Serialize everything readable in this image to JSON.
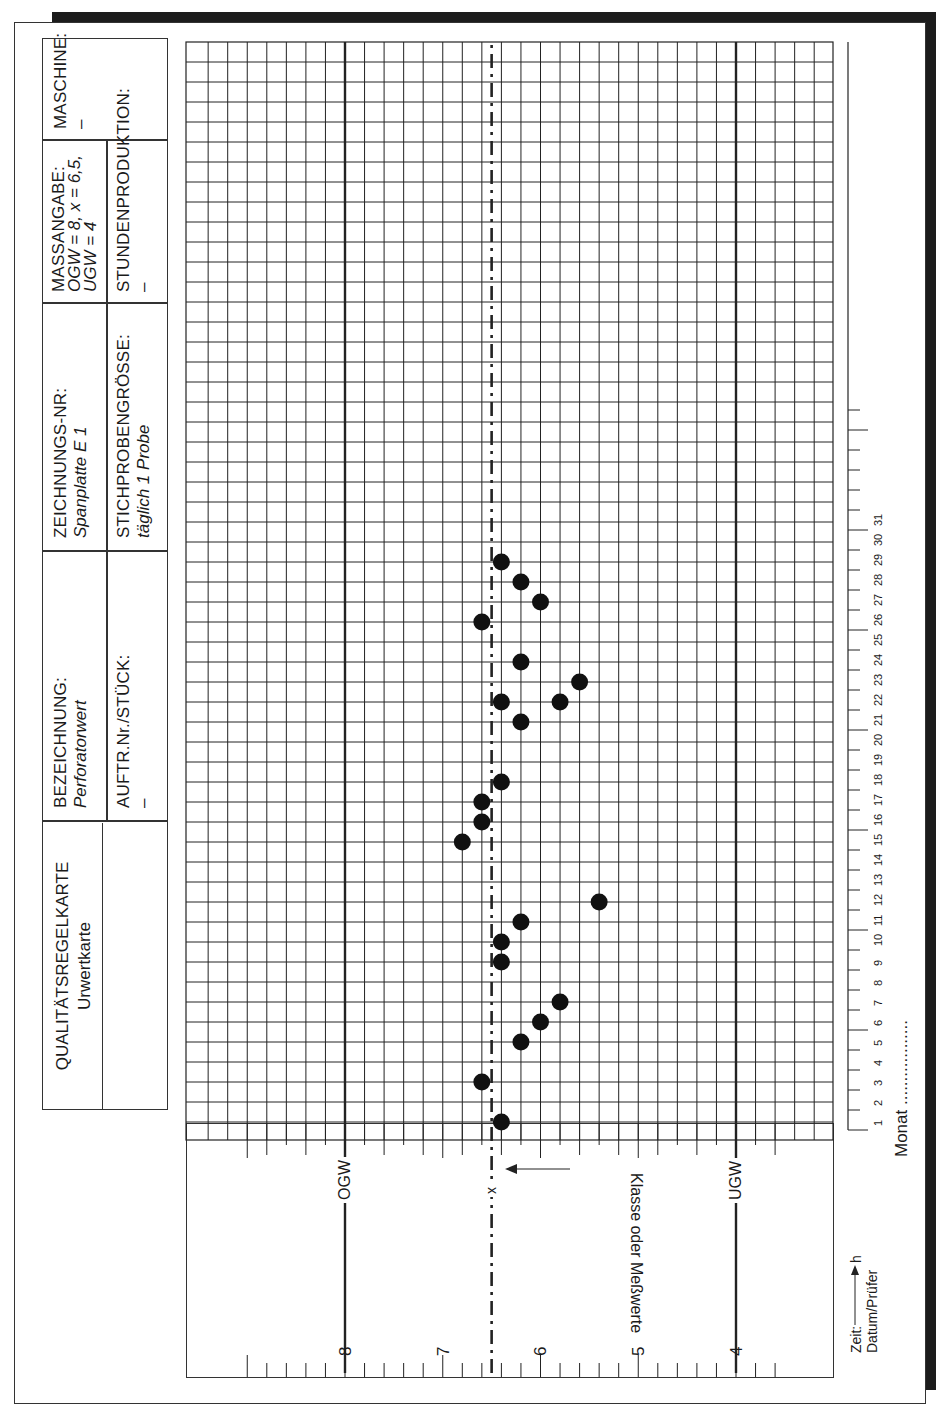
{
  "header": {
    "title": "QUALITÄTSREGELKARTE",
    "subtitle": "Urwertkarte",
    "fields": [
      {
        "label": "BEZEICHNUNG:",
        "value": "Perforatorwert"
      },
      {
        "label": "AUFTR.Nr./STÜCK:",
        "value": "–"
      },
      {
        "label": "ZEICHNUNGS-NR:",
        "value": "Spanplatte E 1"
      },
      {
        "label": "STICHPROBENGRÖSSE:",
        "value": "täglich 1 Probe"
      },
      {
        "label": "MASSANGABE:",
        "value_lines": [
          "OGW = 8, x = 6,5,",
          "UGW = 4"
        ]
      },
      {
        "label": "STUNDENPRODUKTION:",
        "value": "–"
      },
      {
        "label": "MASCHINE:",
        "value": "–"
      }
    ]
  },
  "axis": {
    "value_ticks": [
      "8",
      "7",
      "6",
      "5",
      "4"
    ],
    "ogw_label": "OGW",
    "ugw_label": "UGW",
    "mean_label": "x",
    "axis_caption": "Klasse oder Meßwerte",
    "time_label": "Zeit:",
    "time_unit": "h",
    "date_label": "Datum/Prüfer",
    "month_label": "Monat ..................",
    "day_ticks": [
      "1",
      "2",
      "3",
      "4",
      "5",
      "6",
      "7",
      "8",
      "9",
      "10",
      "11",
      "12",
      "13",
      "14",
      "15",
      "16",
      "17",
      "18",
      "19",
      "20",
      "21",
      "22",
      "23",
      "24",
      "25",
      "26",
      "27",
      "28",
      "29",
      "30",
      "31"
    ]
  },
  "chart_data": {
    "type": "scatter",
    "xlabel": "Datum (Tag des Monats)",
    "ylabel": "Klasse oder Meßwerte",
    "x_range": [
      1,
      31
    ],
    "ylim": [
      3.4,
      9.0
    ],
    "grid": true,
    "reference_lines": [
      {
        "name": "OGW",
        "value": 8.0,
        "style": "solid"
      },
      {
        "name": "x",
        "value": 6.5,
        "style": "dash-dot"
      },
      {
        "name": "UGW",
        "value": 4.0,
        "style": "solid"
      }
    ],
    "points": [
      {
        "x": 1,
        "y": 6.4
      },
      {
        "x": 3,
        "y": 6.6
      },
      {
        "x": 5,
        "y": 6.2
      },
      {
        "x": 6,
        "y": 6.0
      },
      {
        "x": 7,
        "y": 5.8
      },
      {
        "x": 9,
        "y": 6.4
      },
      {
        "x": 10,
        "y": 6.4
      },
      {
        "x": 11,
        "y": 6.2
      },
      {
        "x": 12,
        "y": 5.4
      },
      {
        "x": 15,
        "y": 6.8
      },
      {
        "x": 16,
        "y": 6.6
      },
      {
        "x": 17,
        "y": 6.6
      },
      {
        "x": 18,
        "y": 6.4
      },
      {
        "x": 21,
        "y": 6.2
      },
      {
        "x": 22,
        "y": 6.4
      },
      {
        "x": 22,
        "y": 5.8
      },
      {
        "x": 23,
        "y": 5.6
      },
      {
        "x": 24,
        "y": 6.2
      },
      {
        "x": 26,
        "y": 6.6
      },
      {
        "x": 27,
        "y": 6.0
      },
      {
        "x": 28,
        "y": 6.2
      },
      {
        "x": 29,
        "y": 6.4
      }
    ]
  }
}
